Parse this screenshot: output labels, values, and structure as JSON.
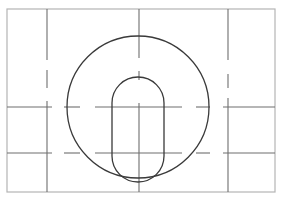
{
  "drawing": {
    "type": "technical-drawing",
    "description": "Circle with vertical slot (obround) and dashed centerlines inside a frame",
    "colors": {
      "background": "#ffffff",
      "frame": "#b4b4b4",
      "centerline": "#6e6e6e",
      "outline": "#3a3a3a"
    },
    "frame": {
      "x": 7,
      "y": 9,
      "width": 268,
      "height": 183
    },
    "circle": {
      "cx": 138,
      "cy": 107,
      "r": 71
    },
    "slot": {
      "x_left": 112,
      "x_right": 164,
      "y_top": 77,
      "y_bottom": 182,
      "radius": 26
    },
    "vertical_centerlines": [
      47,
      139,
      228
    ],
    "horizontal_centerlines": [
      107,
      153
    ]
  }
}
